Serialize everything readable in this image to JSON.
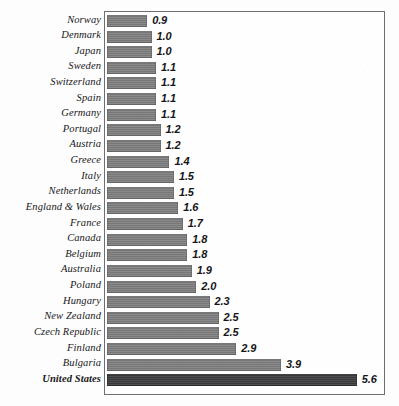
{
  "chart_data": {
    "type": "bar",
    "orientation": "horizontal",
    "title": "",
    "subtitle": "",
    "xlabel": "",
    "ylabel": "",
    "grid": false,
    "legend": null,
    "xlim": [
      0,
      6.3
    ],
    "categories": [
      "Norway",
      "Denmark",
      "Japan",
      "Sweden",
      "Switzerland",
      "Spain",
      "Germany",
      "Portugal",
      "Austria",
      "Greece",
      "Italy",
      "Netherlands",
      "England & Wales",
      "France",
      "Canada",
      "Belgium",
      "Australia",
      "Poland",
      "Hungary",
      "New Zealand",
      "Czech Republic",
      "Finland",
      "Bulgaria",
      "United States"
    ],
    "values": [
      0.9,
      1.0,
      1.0,
      1.1,
      1.1,
      1.1,
      1.1,
      1.2,
      1.2,
      1.4,
      1.5,
      1.5,
      1.6,
      1.7,
      1.8,
      1.8,
      1.9,
      2.0,
      2.3,
      2.5,
      2.5,
      2.9,
      3.9,
      5.6
    ],
    "value_labels": [
      "0.9",
      "1.0",
      "1.0",
      "1.1",
      "1.1",
      "1.1",
      "1.1",
      "1.2",
      "1.2",
      "1.4",
      "1.5",
      "1.5",
      "1.6",
      "1.7",
      "1.8",
      "1.8",
      "1.9",
      "2.0",
      "2.3",
      "2.5",
      "2.5",
      "2.9",
      "3.9",
      "5.6"
    ],
    "highlight_index": 23,
    "colors": {
      "bar": "#7d7d7d",
      "bar_highlight": "#3b3b3d",
      "frame": "#6e6e72",
      "background": "#fdfdfd",
      "text": "#17171a"
    }
  }
}
